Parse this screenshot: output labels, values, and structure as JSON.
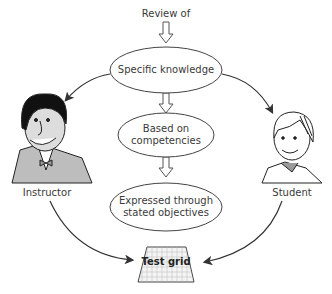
{
  "diagram": {
    "top_label": "Review of",
    "nodes": [
      {
        "id": "specific-knowledge",
        "lines": [
          "Specific knowledge"
        ]
      },
      {
        "id": "based-on-competencies",
        "lines": [
          "Based on",
          "competencies"
        ]
      },
      {
        "id": "expressed-through-objectives",
        "lines": [
          "Expressed through",
          "stated objectives"
        ]
      }
    ],
    "actors": {
      "instructor": {
        "label": "Instructor",
        "icon": "instructor-cartoon-icon"
      },
      "student": {
        "label": "Student",
        "icon": "student-cartoon-icon"
      }
    },
    "target": {
      "label": "Test grid",
      "icon": "grid-sheet-icon"
    },
    "colors": {
      "stroke": "#333333",
      "ellipse_fill": "#ffffff",
      "grid_fill": "#f2f2f2",
      "jacket": "#bdbdbd",
      "hair": "#111111"
    }
  }
}
